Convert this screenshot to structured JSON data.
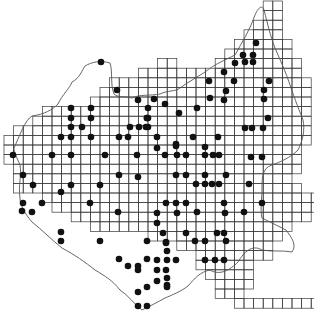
{
  "map": {
    "type": "grid distribution map",
    "background": "#ffffff",
    "ink": "#1a1a1a",
    "grid_step": 9.6,
    "grid_origin": [
      4,
      1
    ],
    "occupied_cells_by_row": [
      [
        27,
        28
      ],
      [
        27,
        28
      ],
      [
        26,
        27,
        28
      ],
      [
        25,
        26,
        27,
        28
      ],
      [
        24,
        25,
        26,
        27,
        28,
        29
      ],
      [
        23,
        24,
        25,
        26,
        27,
        28,
        29
      ],
      [
        16,
        17,
        22,
        23,
        24,
        25,
        26,
        27,
        28,
        29,
        30
      ],
      [
        14,
        15,
        16,
        17,
        18,
        19,
        20,
        21,
        22,
        23,
        24,
        25,
        26,
        27,
        28,
        29,
        30
      ],
      [
        11,
        12,
        13,
        14,
        15,
        16,
        17,
        18,
        19,
        20,
        21,
        22,
        23,
        24,
        25,
        26,
        27,
        28,
        29,
        30,
        31
      ],
      [
        10,
        11,
        12,
        13,
        14,
        15,
        16,
        17,
        18,
        19,
        20,
        21,
        22,
        23,
        24,
        25,
        26,
        27,
        28,
        29,
        30,
        31
      ],
      [
        9,
        10,
        11,
        12,
        13,
        14,
        15,
        16,
        17,
        18,
        19,
        20,
        21,
        22,
        23,
        24,
        25,
        26,
        27,
        28,
        29,
        30,
        31
      ],
      [
        4,
        5,
        6,
        7,
        8,
        9,
        10,
        11,
        12,
        13,
        14,
        15,
        16,
        17,
        18,
        19,
        20,
        21,
        22,
        23,
        24,
        25,
        26,
        27,
        28,
        29,
        30,
        31
      ],
      [
        3,
        4,
        5,
        6,
        7,
        8,
        9,
        10,
        11,
        12,
        13,
        14,
        15,
        16,
        17,
        18,
        19,
        20,
        21,
        22,
        23,
        24,
        25,
        26,
        27,
        28,
        29,
        30,
        31
      ],
      [
        1,
        2,
        3,
        4,
        5,
        6,
        7,
        8,
        9,
        10,
        11,
        12,
        13,
        14,
        15,
        16,
        17,
        18,
        19,
        20,
        21,
        22,
        23,
        24,
        25,
        26,
        27,
        28,
        29,
        30,
        31
      ],
      [
        0,
        1,
        2,
        3,
        4,
        5,
        6,
        7,
        8,
        9,
        10,
        11,
        12,
        13,
        14,
        15,
        16,
        17,
        18,
        19,
        20,
        21,
        22,
        23,
        24,
        25,
        26,
        27,
        28,
        29,
        30,
        31
      ],
      [
        0,
        1,
        2,
        3,
        4,
        5,
        6,
        7,
        8,
        9,
        10,
        11,
        12,
        13,
        14,
        15,
        16,
        17,
        18,
        19,
        20,
        21,
        22,
        23,
        24,
        25,
        26,
        27,
        28,
        29,
        30
      ],
      [
        0,
        1,
        2,
        3,
        4,
        5,
        6,
        7,
        8,
        9,
        10,
        11,
        12,
        13,
        14,
        15,
        16,
        17,
        18,
        19,
        20,
        21,
        22,
        23,
        24,
        25,
        26,
        27,
        28,
        29,
        30
      ],
      [
        1,
        2,
        3,
        4,
        5,
        6,
        7,
        8,
        9,
        10,
        11,
        12,
        13,
        14,
        15,
        16,
        17,
        18,
        19,
        20,
        21,
        22,
        23,
        24,
        25,
        26,
        27,
        28,
        29,
        30
      ],
      [
        1,
        2,
        3,
        4,
        5,
        6,
        7,
        8,
        9,
        10,
        11,
        12,
        13,
        14,
        15,
        16,
        17,
        18,
        19,
        20,
        21,
        22,
        23,
        24,
        25,
        26,
        27,
        28,
        29
      ],
      [
        1,
        2,
        3,
        4,
        5,
        6,
        7,
        8,
        9,
        10,
        11,
        12,
        13,
        14,
        15,
        16,
        17,
        18,
        19,
        20,
        21,
        22,
        23,
        24,
        25,
        26,
        27,
        28,
        29,
        30
      ],
      [
        4,
        5,
        6,
        7,
        8,
        9,
        10,
        11,
        12,
        13,
        14,
        15,
        16,
        17,
        18,
        19,
        20,
        21,
        22,
        23,
        24,
        25,
        26,
        27,
        28,
        29,
        30,
        31,
        32
      ],
      [
        5,
        6,
        7,
        8,
        9,
        10,
        11,
        12,
        13,
        14,
        15,
        16,
        17,
        18,
        19,
        20,
        21,
        22,
        23,
        24,
        25,
        26,
        27,
        28,
        29,
        30,
        31,
        32
      ],
      [
        7,
        8,
        9,
        10,
        11,
        12,
        13,
        14,
        15,
        16,
        17,
        18,
        19,
        20,
        21,
        22,
        23,
        24,
        25,
        26,
        27,
        28,
        29,
        30,
        31
      ],
      [
        9,
        10,
        11,
        12,
        13,
        14,
        15,
        16,
        17,
        18,
        19,
        20,
        21,
        22,
        23,
        24,
        25,
        26,
        27,
        28,
        29
      ],
      [
        15,
        16,
        17,
        18,
        19,
        20,
        21,
        22,
        23,
        24,
        25,
        26,
        27,
        28
      ],
      [
        18,
        19,
        20,
        21,
        22,
        23,
        24,
        25,
        26,
        27
      ],
      [
        20,
        21,
        22,
        23,
        24,
        25,
        26,
        27
      ],
      [
        20,
        21,
        22,
        23,
        24,
        25
      ],
      [
        21,
        22,
        23,
        24,
        25
      ],
      [
        22,
        23,
        24,
        25
      ],
      [
        22,
        23,
        24
      ],
      [
        24,
        25,
        26,
        27,
        28,
        29,
        30,
        31,
        32
      ]
    ],
    "dots": [
      [
        101,
        62
      ],
      [
        256,
        43
      ],
      [
        243,
        55
      ],
      [
        253,
        55
      ],
      [
        235,
        63
      ],
      [
        245,
        62
      ],
      [
        253,
        62
      ],
      [
        117,
        90
      ],
      [
        138,
        100
      ],
      [
        154,
        99
      ],
      [
        165,
        104
      ],
      [
        224,
        72
      ],
      [
        234,
        81
      ],
      [
        209,
        81
      ],
      [
        226,
        91
      ],
      [
        210,
        98
      ],
      [
        224,
        100
      ],
      [
        269,
        81
      ],
      [
        264,
        90
      ],
      [
        264,
        99
      ],
      [
        71,
        108
      ],
      [
        91,
        108
      ],
      [
        148,
        108
      ],
      [
        179,
        113
      ],
      [
        71,
        118
      ],
      [
        91,
        118
      ],
      [
        147,
        118
      ],
      [
        148,
        118
      ],
      [
        197,
        108
      ],
      [
        71,
        127
      ],
      [
        82,
        127
      ],
      [
        146,
        127
      ],
      [
        130,
        127
      ],
      [
        139,
        127
      ],
      [
        148,
        127
      ],
      [
        147,
        118
      ],
      [
        71,
        137
      ],
      [
        61,
        137
      ],
      [
        91,
        137
      ],
      [
        119,
        137
      ],
      [
        128,
        137
      ],
      [
        157,
        137
      ],
      [
        193,
        137
      ],
      [
        218,
        137
      ],
      [
        268,
        118
      ],
      [
        245,
        128
      ],
      [
        252,
        128
      ],
      [
        263,
        128
      ],
      [
        13,
        155
      ],
      [
        52,
        155
      ],
      [
        71,
        155
      ],
      [
        105,
        155
      ],
      [
        137,
        155
      ],
      [
        165,
        155
      ],
      [
        177,
        155
      ],
      [
        205,
        155
      ],
      [
        213,
        155
      ],
      [
        251,
        157
      ],
      [
        262,
        157
      ],
      [
        157,
        148
      ],
      [
        176,
        144
      ],
      [
        176,
        146
      ],
      [
        205,
        147
      ],
      [
        219,
        155
      ],
      [
        186,
        155
      ],
      [
        23,
        175
      ],
      [
        33,
        185
      ],
      [
        61,
        192
      ],
      [
        71,
        185
      ],
      [
        100,
        185
      ],
      [
        119,
        175
      ],
      [
        138,
        177
      ],
      [
        186,
        175
      ],
      [
        176,
        175
      ],
      [
        205,
        175
      ],
      [
        226,
        175
      ],
      [
        196,
        184
      ],
      [
        205,
        184
      ],
      [
        212,
        184
      ],
      [
        219,
        184
      ],
      [
        249,
        184
      ],
      [
        23,
        203
      ],
      [
        42,
        203
      ],
      [
        22,
        211
      ],
      [
        32,
        212
      ],
      [
        90,
        203
      ],
      [
        118,
        212
      ],
      [
        157,
        213
      ],
      [
        177,
        213
      ],
      [
        186,
        203
      ],
      [
        166,
        203
      ],
      [
        176,
        203
      ],
      [
        197,
        212
      ],
      [
        225,
        213
      ],
      [
        244,
        212
      ],
      [
        224,
        203
      ],
      [
        262,
        203
      ],
      [
        157,
        223
      ],
      [
        186,
        233
      ],
      [
        163,
        233
      ],
      [
        217,
        233
      ],
      [
        224,
        233
      ],
      [
        226,
        241
      ],
      [
        61,
        232
      ],
      [
        61,
        241
      ],
      [
        100,
        241
      ],
      [
        147,
        241
      ],
      [
        195,
        241
      ],
      [
        205,
        241
      ],
      [
        166,
        242
      ],
      [
        167,
        251
      ],
      [
        166,
        243
      ],
      [
        119,
        259
      ],
      [
        138,
        266
      ],
      [
        157,
        260
      ],
      [
        167,
        260
      ],
      [
        176,
        260
      ],
      [
        205,
        260
      ],
      [
        215,
        260
      ],
      [
        224,
        260
      ],
      [
        166,
        270
      ],
      [
        167,
        278
      ],
      [
        138,
        270
      ],
      [
        157,
        270
      ],
      [
        147,
        259
      ],
      [
        128,
        266
      ],
      [
        167,
        285
      ],
      [
        157,
        281
      ],
      [
        167,
        287
      ],
      [
        147,
        287
      ],
      [
        138,
        292
      ],
      [
        138,
        306
      ],
      [
        147,
        306
      ]
    ],
    "bottom_label": ""
  }
}
